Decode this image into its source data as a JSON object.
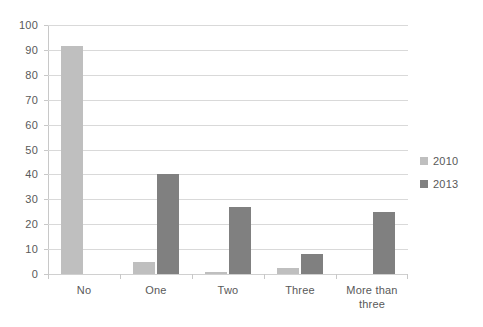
{
  "chart_data": {
    "type": "bar",
    "title": "",
    "subtitle": "",
    "xlabel": "",
    "ylabel": "",
    "categories": [
      "No",
      "One",
      "Two",
      "Three",
      "More than three"
    ],
    "series": [
      {
        "name": "2010",
        "color": "#bfbfbf",
        "values": [
          91.5,
          5,
          0.7,
          2.3,
          0
        ]
      },
      {
        "name": "2013",
        "color": "#808080",
        "values": [
          0,
          40,
          27,
          8,
          25
        ]
      }
    ],
    "ylim": [
      0,
      100
    ],
    "y_ticks": [
      0,
      10,
      20,
      30,
      40,
      50,
      60,
      70,
      80,
      90,
      100
    ],
    "y_tick_labels": [
      "0",
      "10",
      "20",
      "30",
      "40",
      "50",
      "60",
      "70",
      "80",
      "90",
      "100"
    ],
    "grid": true,
    "legend_position": "right",
    "legend": [
      {
        "label": "2010",
        "color": "#bfbfbf"
      },
      {
        "label": "2013",
        "color": "#808080"
      }
    ],
    "background_color": "#ffffff",
    "gridline_color": "#d9d9d9",
    "text_color": "#595959"
  }
}
